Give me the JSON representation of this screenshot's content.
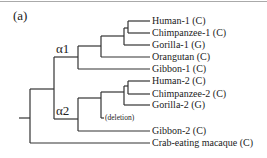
{
  "panel_label": "(a)",
  "nodes": {
    "alpha1": "α1",
    "alpha2": "α2"
  },
  "deletion_label": "(deletion)",
  "leaves": [
    "Human-1 (C)",
    "Chimpanzee-1 (C)",
    "Gorilla-1 (G)",
    "Orangutan (C)",
    "Gibbon-1 (C)",
    "Human-2 (C)",
    "Chimpanzee-2 (C)",
    "Gorilla-2 (G)",
    "Gibbon-2 (C)",
    "Crab-eating macaque (C)"
  ]
}
